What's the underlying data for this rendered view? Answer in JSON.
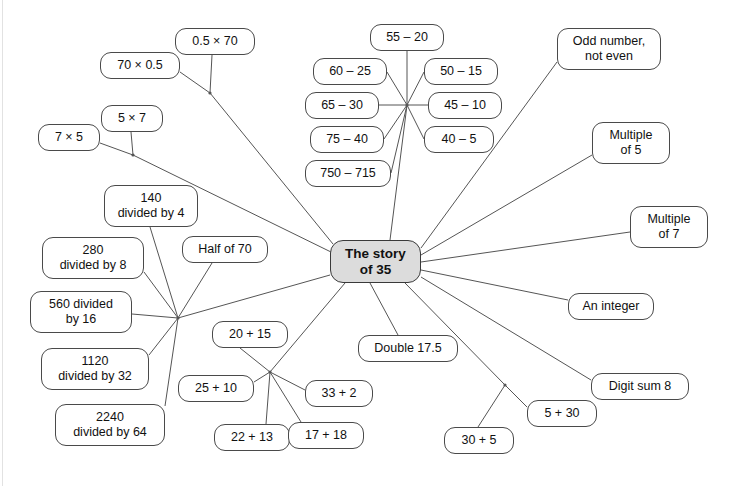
{
  "diagram": {
    "title": "The story of 35",
    "type": "mind-map",
    "colors": {
      "center_fill": "#dcdcdc",
      "node_fill": "#ffffff",
      "node_border": "#4a4a4a",
      "edge": "#555555",
      "text": "#111111"
    },
    "center": {
      "label": "The story\nof 35",
      "x": 330,
      "y": 240,
      "w": 91,
      "h": 43
    },
    "nodes": [
      {
        "name": "node-0-5-times-70",
        "label": "0.5 × 70",
        "x": 175,
        "y": 28,
        "w": 80,
        "h": 27
      },
      {
        "name": "node-70-times-0-5",
        "label": "70 × 0.5",
        "x": 100,
        "y": 52,
        "w": 80,
        "h": 27
      },
      {
        "name": "node-5-times-7",
        "label": "5 × 7",
        "x": 101,
        "y": 105,
        "w": 62,
        "h": 27
      },
      {
        "name": "node-7-times-5",
        "label": "7 × 5",
        "x": 38,
        "y": 124,
        "w": 62,
        "h": 27
      },
      {
        "name": "node-55-minus-20",
        "label": "55 – 20",
        "x": 370,
        "y": 24,
        "w": 74,
        "h": 27
      },
      {
        "name": "node-60-minus-25",
        "label": "60 – 25",
        "x": 313,
        "y": 58,
        "w": 74,
        "h": 27
      },
      {
        "name": "node-50-minus-15",
        "label": "50 – 15",
        "x": 424,
        "y": 58,
        "w": 74,
        "h": 27
      },
      {
        "name": "node-65-minus-30",
        "label": "65 – 30",
        "x": 305,
        "y": 92,
        "w": 74,
        "h": 27
      },
      {
        "name": "node-45-minus-10",
        "label": "45 – 10",
        "x": 428,
        "y": 92,
        "w": 74,
        "h": 27
      },
      {
        "name": "node-75-minus-40",
        "label": "75 – 40",
        "x": 310,
        "y": 126,
        "w": 74,
        "h": 27
      },
      {
        "name": "node-40-minus-5",
        "label": "40 – 5",
        "x": 424,
        "y": 126,
        "w": 70,
        "h": 27
      },
      {
        "name": "node-750-minus-715",
        "label": "750 – 715",
        "x": 305,
        "y": 160,
        "w": 86,
        "h": 27
      },
      {
        "name": "node-odd-number",
        "label": "Odd number,\nnot even",
        "x": 557,
        "y": 28,
        "w": 104,
        "h": 42
      },
      {
        "name": "node-multiple-of-5",
        "label": "Multiple\nof 5",
        "x": 592,
        "y": 122,
        "w": 78,
        "h": 42
      },
      {
        "name": "node-multiple-of-7",
        "label": "Multiple\nof 7",
        "x": 630,
        "y": 206,
        "w": 78,
        "h": 42
      },
      {
        "name": "node-an-integer",
        "label": "An integer",
        "x": 568,
        "y": 293,
        "w": 86,
        "h": 27
      },
      {
        "name": "node-digit-sum-8",
        "label": "Digit sum 8",
        "x": 591,
        "y": 373,
        "w": 98,
        "h": 27
      },
      {
        "name": "node-140-divided-by-4",
        "label": "140\ndivided by 4",
        "x": 104,
        "y": 185,
        "w": 94,
        "h": 42
      },
      {
        "name": "node-half-of-70",
        "label": "Half of 70",
        "x": 182,
        "y": 236,
        "w": 86,
        "h": 27
      },
      {
        "name": "node-280-divided-by-8",
        "label": "280\ndivided by 8",
        "x": 42,
        "y": 237,
        "w": 102,
        "h": 42
      },
      {
        "name": "node-560-divided-by-16",
        "label": "560 divided\nby 16",
        "x": 30,
        "y": 291,
        "w": 102,
        "h": 42
      },
      {
        "name": "node-1120-divided-by-32",
        "label": "1120\ndivided by 32",
        "x": 41,
        "y": 348,
        "w": 108,
        "h": 42
      },
      {
        "name": "node-2240-divided-by-64",
        "label": "2240\ndivided by 64",
        "x": 55,
        "y": 404,
        "w": 110,
        "h": 42
      },
      {
        "name": "node-20-plus-15",
        "label": "20 + 15",
        "x": 212,
        "y": 321,
        "w": 76,
        "h": 27
      },
      {
        "name": "node-25-plus-10",
        "label": "25 + 10",
        "x": 178,
        "y": 375,
        "w": 76,
        "h": 27
      },
      {
        "name": "node-33-plus-2",
        "label": "33 + 2",
        "x": 305,
        "y": 380,
        "w": 68,
        "h": 27
      },
      {
        "name": "node-22-plus-13",
        "label": "22 + 13",
        "x": 214,
        "y": 424,
        "w": 76,
        "h": 27
      },
      {
        "name": "node-17-plus-18",
        "label": "17 + 18",
        "x": 288,
        "y": 422,
        "w": 76,
        "h": 27
      },
      {
        "name": "node-double-17-5",
        "label": "Double 17.5",
        "x": 358,
        "y": 335,
        "w": 100,
        "h": 27
      },
      {
        "name": "node-5-plus-30",
        "label": "5 + 30",
        "x": 527,
        "y": 400,
        "w": 70,
        "h": 27
      },
      {
        "name": "node-30-plus-5",
        "label": "30 + 5",
        "x": 444,
        "y": 427,
        "w": 70,
        "h": 27
      }
    ],
    "hubs": [
      {
        "name": "hub-multiply-upper",
        "x": 210,
        "y": 93
      },
      {
        "name": "hub-multiply-lower",
        "x": 133,
        "y": 155
      },
      {
        "name": "hub-subtract",
        "x": 407,
        "y": 105
      },
      {
        "name": "hub-divide",
        "x": 178,
        "y": 318
      },
      {
        "name": "hub-add",
        "x": 270,
        "y": 372
      },
      {
        "name": "hub-plus-pair",
        "x": 505,
        "y": 385
      }
    ],
    "edges": [
      {
        "name": "edge-0-5x70-to-hub",
        "x1": 212,
        "y1": 55,
        "x2": 210,
        "y2": 93
      },
      {
        "name": "edge-70x0-5-to-hub",
        "x1": 180,
        "y1": 72,
        "x2": 210,
        "y2": 93
      },
      {
        "name": "edge-hub-mult-upper-ctr",
        "x1": 210,
        "y1": 93,
        "x2": 333,
        "y2": 244
      },
      {
        "name": "edge-5x7-to-hub",
        "x1": 131,
        "y1": 132,
        "x2": 133,
        "y2": 155
      },
      {
        "name": "edge-7x5-to-hub",
        "x1": 100,
        "y1": 143,
        "x2": 133,
        "y2": 155
      },
      {
        "name": "edge-hub-mult-lower-ctr",
        "x1": 133,
        "y1": 155,
        "x2": 331,
        "y2": 252
      },
      {
        "name": "edge-55-20",
        "x1": 407,
        "y1": 51,
        "x2": 407,
        "y2": 105
      },
      {
        "name": "edge-60-25",
        "x1": 387,
        "y1": 72,
        "x2": 407,
        "y2": 105
      },
      {
        "name": "edge-50-15",
        "x1": 424,
        "y1": 72,
        "x2": 407,
        "y2": 105
      },
      {
        "name": "edge-65-30",
        "x1": 379,
        "y1": 105,
        "x2": 407,
        "y2": 105
      },
      {
        "name": "edge-45-10",
        "x1": 428,
        "y1": 105,
        "x2": 407,
        "y2": 105
      },
      {
        "name": "edge-75-40",
        "x1": 384,
        "y1": 139,
        "x2": 407,
        "y2": 105
      },
      {
        "name": "edge-40-5",
        "x1": 424,
        "y1": 139,
        "x2": 407,
        "y2": 105
      },
      {
        "name": "edge-750-715",
        "x1": 391,
        "y1": 173,
        "x2": 407,
        "y2": 105
      },
      {
        "name": "edge-hub-sub-ctr",
        "x1": 407,
        "y1": 105,
        "x2": 390,
        "y2": 240
      },
      {
        "name": "edge-odd-number",
        "x1": 557,
        "y1": 62,
        "x2": 421,
        "y2": 248
      },
      {
        "name": "edge-multiple-of-5",
        "x1": 592,
        "y1": 155,
        "x2": 421,
        "y2": 255
      },
      {
        "name": "edge-multiple-of-7",
        "x1": 630,
        "y1": 232,
        "x2": 421,
        "y2": 262
      },
      {
        "name": "edge-an-integer",
        "x1": 568,
        "y1": 300,
        "x2": 421,
        "y2": 270
      },
      {
        "name": "edge-digit-sum-8",
        "x1": 591,
        "y1": 380,
        "x2": 421,
        "y2": 277
      },
      {
        "name": "edge-140-div-4",
        "x1": 150,
        "y1": 227,
        "x2": 178,
        "y2": 318
      },
      {
        "name": "edge-half-of-70",
        "x1": 212,
        "y1": 263,
        "x2": 178,
        "y2": 318
      },
      {
        "name": "edge-280-div-8",
        "x1": 144,
        "y1": 272,
        "x2": 178,
        "y2": 318
      },
      {
        "name": "edge-560-div-16",
        "x1": 132,
        "y1": 314,
        "x2": 178,
        "y2": 318
      },
      {
        "name": "edge-1120-div-32",
        "x1": 149,
        "y1": 355,
        "x2": 178,
        "y2": 318
      },
      {
        "name": "edge-2240-div-64",
        "x1": 165,
        "y1": 406,
        "x2": 178,
        "y2": 318
      },
      {
        "name": "edge-hub-div-ctr",
        "x1": 178,
        "y1": 318,
        "x2": 330,
        "y2": 275
      },
      {
        "name": "edge-20-plus-15",
        "x1": 240,
        "y1": 348,
        "x2": 270,
        "y2": 372
      },
      {
        "name": "edge-25-plus-10",
        "x1": 254,
        "y1": 382,
        "x2": 270,
        "y2": 372
      },
      {
        "name": "edge-33-plus-2",
        "x1": 305,
        "y1": 390,
        "x2": 270,
        "y2": 372
      },
      {
        "name": "edge-22-plus-13",
        "x1": 266,
        "y1": 424,
        "x2": 270,
        "y2": 372
      },
      {
        "name": "edge-17-plus-18",
        "x1": 301,
        "y1": 422,
        "x2": 270,
        "y2": 372
      },
      {
        "name": "edge-hub-add-ctr",
        "x1": 270,
        "y1": 372,
        "x2": 345,
        "y2": 283
      },
      {
        "name": "edge-double-17-5",
        "x1": 398,
        "y1": 335,
        "x2": 370,
        "y2": 283
      },
      {
        "name": "edge-5-plus-30",
        "x1": 527,
        "y1": 407,
        "x2": 505,
        "y2": 385
      },
      {
        "name": "edge-30-plus-5",
        "x1": 478,
        "y1": 427,
        "x2": 505,
        "y2": 385
      },
      {
        "name": "edge-hub-pair-ctr",
        "x1": 505,
        "y1": 385,
        "x2": 405,
        "y2": 283
      }
    ]
  }
}
